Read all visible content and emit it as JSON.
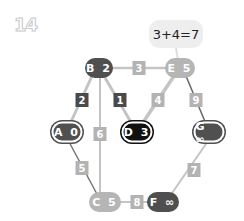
{
  "title": "14",
  "bubble": {
    "text": "3+4=7"
  },
  "colors": {
    "dark": "#4f4f4f",
    "light": "#b5b5b5",
    "black": "#111111",
    "edge_light": "#c4c4c4",
    "edge_dark": "#666666"
  },
  "nodes": [
    {
      "id": "B",
      "label": "B 2",
      "style": "dark"
    },
    {
      "id": "E",
      "label": "E 5",
      "style": "light"
    },
    {
      "id": "A",
      "label": "A 0",
      "style": "outlined-dark"
    },
    {
      "id": "D",
      "label": "D 3",
      "style": "outlined-black"
    },
    {
      "id": "G",
      "label": "G ∞",
      "style": "outlined-dark"
    },
    {
      "id": "C",
      "label": "C 5",
      "style": "light"
    },
    {
      "id": "F",
      "label": "F ∞",
      "style": "dark"
    }
  ],
  "edges": [
    {
      "from": "B",
      "to": "E",
      "weight": "3"
    },
    {
      "from": "B",
      "to": "A",
      "weight": "2"
    },
    {
      "from": "B",
      "to": "D",
      "weight": "1"
    },
    {
      "from": "B",
      "to": "C",
      "weight": "6"
    },
    {
      "from": "E",
      "to": "D",
      "weight": "4"
    },
    {
      "from": "E",
      "to": "G",
      "weight": "9"
    },
    {
      "from": "A",
      "to": "C",
      "weight": "5"
    },
    {
      "from": "G",
      "to": "F",
      "weight": "7"
    },
    {
      "from": "C",
      "to": "F",
      "weight": "8"
    }
  ]
}
